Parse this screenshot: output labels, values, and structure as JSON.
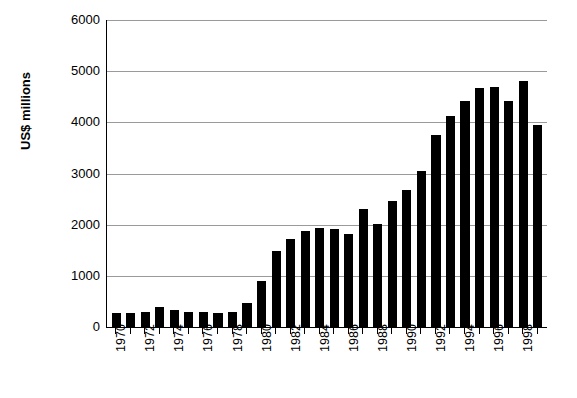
{
  "chart_data": {
    "type": "bar",
    "title": "",
    "xlabel": "",
    "ylabel": "US$ millions",
    "ylim": [
      0,
      6000
    ],
    "yticks": [
      0,
      1000,
      2000,
      3000,
      4000,
      5000,
      6000
    ],
    "ytick_labels": [
      "6000",
      "5000",
      "4000",
      "3000",
      "2000",
      "1000",
      "0"
    ],
    "grid": true,
    "legend": null,
    "bar_color": "#000000",
    "gridline_color": "#9a9a9a",
    "axis_color": "#000000",
    "xtick_label_interval": 2,
    "categories": [
      "1970",
      "1971",
      "1972",
      "1973",
      "1974",
      "1975",
      "1976",
      "1977",
      "1978",
      "1979",
      "1980",
      "1981",
      "1982",
      "1983",
      "1984",
      "1985",
      "1986",
      "1987",
      "1988",
      "1989",
      "1990",
      "1991",
      "1992",
      "1993",
      "1994",
      "1995",
      "1996",
      "1997",
      "1998",
      "1999"
    ],
    "visible_xtick_labels": [
      "1970",
      "",
      "1972",
      "",
      "1974",
      "",
      "1976",
      "",
      "1978",
      "",
      "1980",
      "",
      "1982",
      "",
      "1984",
      "",
      "1986",
      "",
      "1988",
      "",
      "1990",
      "",
      "1992",
      "",
      "1994",
      "",
      "1996",
      "",
      "1998",
      ""
    ],
    "values": [
      270,
      280,
      300,
      390,
      330,
      300,
      290,
      280,
      290,
      470,
      900,
      1480,
      1720,
      1880,
      1930,
      1920,
      1820,
      2300,
      2010,
      2470,
      2680,
      3050,
      3760,
      4130,
      4420,
      4680,
      4690,
      4420,
      4800,
      3950
    ]
  }
}
